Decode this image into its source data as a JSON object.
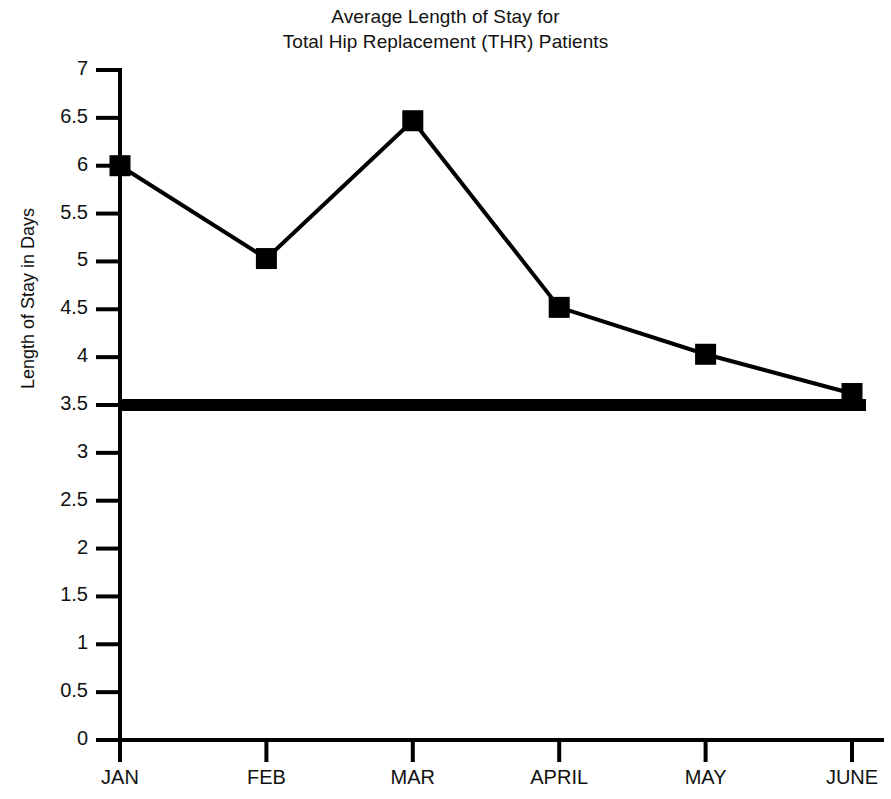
{
  "chart_data": {
    "type": "line",
    "title": "Average Length of Stay for Total Hip Replacement (THR) Patients",
    "title_lines": [
      "Average Length of Stay for",
      "Total Hip Replacement (THR) Patients"
    ],
    "xlabel": "",
    "ylabel": "Length of Stay in Days",
    "categories": [
      "JAN",
      "FEB",
      "MAR",
      "APRIL",
      "MAY",
      "JUNE"
    ],
    "values": [
      6.0,
      5.03,
      6.47,
      4.52,
      4.03,
      3.62
    ],
    "series": [
      {
        "name": "Average Length of Stay",
        "values": [
          6.0,
          5.03,
          6.47,
          4.52,
          4.03,
          3.62
        ]
      }
    ],
    "ylim": [
      0,
      7
    ],
    "ytick_step": 0.5,
    "ytick_labels": [
      "7",
      "6.5",
      "6",
      "5.5",
      "5",
      "4.5",
      "4",
      "3.5",
      "3",
      "2.5",
      "2",
      "1.5",
      "1",
      "0.5",
      "0"
    ],
    "ytick_values": [
      7,
      6.5,
      6,
      5.5,
      5,
      4.5,
      4,
      3.5,
      3,
      2.5,
      2,
      1.5,
      1,
      0.5,
      0
    ],
    "grid": false,
    "legend": "none",
    "marker": "square",
    "line_color": "#000000",
    "marker_color": "#000000",
    "background_color": "#ffffff",
    "reference_line": {
      "value": 3.5,
      "label": "",
      "color": "#000000",
      "thickness": 12
    },
    "annotations": []
  }
}
